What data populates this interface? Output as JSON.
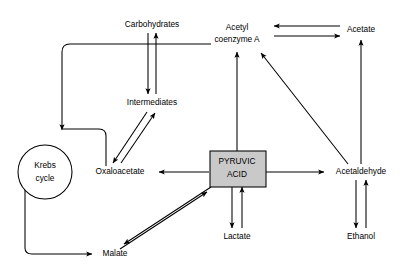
{
  "diagram": {
    "type": "metabolic-pathway-diagram",
    "background_color": "#ffffff",
    "line_color": "#000000",
    "highlight_fill": "#c9c9c9",
    "nodes": [
      {
        "id": "carbohydrates",
        "label": "Carbohydrates",
        "shape": "text",
        "x": 152,
        "y": 25
      },
      {
        "id": "acetyl_coa_l1",
        "label": "Acetyl",
        "shape": "text",
        "x": 237,
        "y": 28
      },
      {
        "id": "acetyl_coa_l2",
        "label": "coenzyme A",
        "shape": "text",
        "x": 237,
        "y": 40
      },
      {
        "id": "acetate",
        "label": "Acetate",
        "shape": "text",
        "x": 361,
        "y": 30
      },
      {
        "id": "intermediates",
        "label": "Intermediates",
        "shape": "text",
        "x": 152,
        "y": 103
      },
      {
        "id": "krebs_l1",
        "label": "Krebs",
        "shape": "circle",
        "x": 45,
        "y": 165
      },
      {
        "id": "krebs_l2",
        "label": "cycle",
        "shape": "circle",
        "x": 45,
        "y": 178
      },
      {
        "id": "oxaloacetate",
        "label": "Oxaloacetate",
        "shape": "text",
        "x": 120,
        "y": 172
      },
      {
        "id": "pyruvic_l1",
        "label": "PYRUVIC",
        "shape": "box",
        "x": 237,
        "y": 162
      },
      {
        "id": "pyruvic_l2",
        "label": "ACID",
        "shape": "box",
        "x": 237,
        "y": 175
      },
      {
        "id": "acetaldehyde",
        "label": "Acetaldehyde",
        "shape": "text",
        "x": 361,
        "y": 172
      },
      {
        "id": "lactate",
        "label": "Lactate",
        "shape": "text",
        "x": 237,
        "y": 237
      },
      {
        "id": "ethanol",
        "label": "Ethanol",
        "shape": "text",
        "x": 361,
        "y": 237
      },
      {
        "id": "malate",
        "label": "Malate",
        "shape": "text",
        "x": 115,
        "y": 254
      }
    ],
    "edges": [
      {
        "id": "carbohydrates-to-intermediates",
        "from": "carbohydrates",
        "to": "intermediates",
        "direction": "down"
      },
      {
        "id": "intermediates-to-carbohydrates",
        "from": "intermediates",
        "to": "carbohydrates",
        "direction": "up"
      },
      {
        "id": "intermediates-to-krebs",
        "from": "intermediates",
        "to": "krebs",
        "direction": "left-down"
      },
      {
        "id": "oxaloacetate-to-intermediates",
        "from": "oxaloacetate",
        "to": "intermediates",
        "direction": "up-right"
      },
      {
        "id": "intermediates-to-oxaloacetate",
        "from": "intermediates",
        "to": "oxaloacetate",
        "direction": "down-left"
      },
      {
        "id": "krebs-to-oxaloacetate",
        "from": "krebs",
        "to": "oxaloacetate",
        "direction": "right"
      },
      {
        "id": "krebs-to-malate",
        "from": "krebs",
        "to": "malate",
        "direction": "down-right"
      },
      {
        "id": "malate-to-pyruvic",
        "from": "malate",
        "to": "pyruvic_acid",
        "direction": "up-right"
      },
      {
        "id": "pyruvic-to-malate",
        "from": "pyruvic_acid",
        "to": "malate",
        "direction": "down-left"
      },
      {
        "id": "pyruvic-to-oxaloacetate",
        "from": "pyruvic_acid",
        "to": "oxaloacetate",
        "direction": "left"
      },
      {
        "id": "pyruvic-to-acetyl-coa",
        "from": "pyruvic_acid",
        "to": "acetyl_coa",
        "direction": "up"
      },
      {
        "id": "pyruvic-to-acetaldehyde",
        "from": "pyruvic_acid",
        "to": "acetaldehyde",
        "direction": "right"
      },
      {
        "id": "pyruvic-to-lactate",
        "from": "pyruvic_acid",
        "to": "lactate",
        "direction": "down"
      },
      {
        "id": "lactate-to-pyruvic",
        "from": "lactate",
        "to": "pyruvic_acid",
        "direction": "up"
      },
      {
        "id": "acetaldehyde-to-ethanol",
        "from": "acetaldehyde",
        "to": "ethanol",
        "direction": "down"
      },
      {
        "id": "ethanol-to-acetaldehyde",
        "from": "ethanol",
        "to": "acetaldehyde",
        "direction": "up"
      },
      {
        "id": "acetaldehyde-to-acetate",
        "from": "acetaldehyde",
        "to": "acetate",
        "direction": "up"
      },
      {
        "id": "acetaldehyde-to-acetyl-coa",
        "from": "acetaldehyde",
        "to": "acetyl_coa",
        "direction": "up-left"
      },
      {
        "id": "acetate-to-acetyl-coa",
        "from": "acetate",
        "to": "acetyl_coa",
        "direction": "left"
      },
      {
        "id": "acetyl-coa-to-acetate",
        "from": "acetyl_coa",
        "to": "acetate",
        "direction": "right"
      }
    ]
  }
}
